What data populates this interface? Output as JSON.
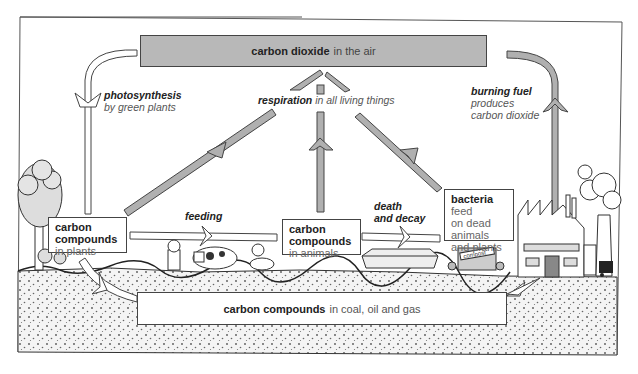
{
  "diagram": {
    "colors": {
      "arrow_fill": "#b0b0b0",
      "co2_box_fill": "#b8b8b8",
      "ground_fill": "#efefef",
      "outline": "#444444"
    },
    "co2_box": {
      "bold": "carbon dioxide",
      "rest": "in the air"
    },
    "fossil_box": {
      "bold": "carbon compounds",
      "rest": "in coal, oil and gas"
    },
    "plants_box": {
      "bold_line1": "carbon",
      "bold_line2": "compounds",
      "rest": "in plants"
    },
    "animals_box": {
      "bold_line1": "carbon",
      "bold_line2": "compounds",
      "rest": "in animals"
    },
    "bacteria_box": {
      "bold": "bacteria",
      "line1_rest": "feed",
      "line2": "on dead",
      "line3": "animals",
      "line4": "and plants"
    },
    "labels": {
      "photosynthesis": {
        "bold": "photosynthesis",
        "rest": "by green plants"
      },
      "respiration": {
        "bold": "respiration",
        "rest": "in all living things"
      },
      "burning": {
        "bold": "burning fuel",
        "line2": "produces",
        "line3": "carbon dioxide"
      },
      "feeding": "feeding",
      "death": {
        "line1": "death",
        "line2": "and decay"
      }
    },
    "illustrations": {
      "compost_sign": "compost"
    }
  }
}
